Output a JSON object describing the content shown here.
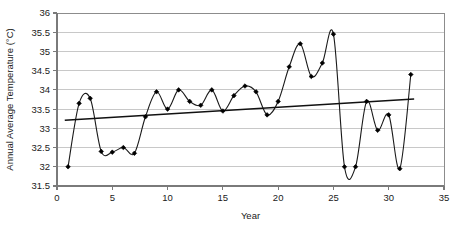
{
  "chart_data": {
    "type": "line",
    "title": "",
    "xlabel": "Year",
    "ylabel": "Annual Average Temperature (°C)",
    "xlim": [
      0,
      35
    ],
    "ylim": [
      31.5,
      36
    ],
    "xticks": [
      0,
      5,
      10,
      15,
      20,
      25,
      30,
      35
    ],
    "yticks": [
      31.5,
      32,
      32.5,
      33,
      33.5,
      34,
      34.5,
      35,
      35.5,
      36
    ],
    "xtick_labels": [
      "0",
      "5",
      "10",
      "15",
      "20",
      "25",
      "30",
      "35"
    ],
    "ytick_labels": [
      "31.5",
      "32",
      "32.5",
      "33",
      "33.5",
      "34",
      "34.5",
      "35",
      "35.5",
      "36"
    ],
    "grid": "horizontal",
    "legend": "none",
    "marker": "diamond",
    "line_color": "#1a1a1a",
    "marker_color": "#000000",
    "grid_color": "#c8c8c8",
    "axis_color": "#808080",
    "x": [
      1,
      2,
      3,
      4,
      5,
      6,
      7,
      8,
      9,
      10,
      11,
      12,
      13,
      14,
      15,
      16,
      17,
      18,
      19,
      20,
      21,
      22,
      23,
      24,
      25,
      26,
      27,
      28,
      29,
      30,
      31,
      32
    ],
    "values": [
      32.0,
      33.65,
      33.78,
      32.4,
      32.38,
      32.5,
      32.35,
      33.3,
      33.95,
      33.5,
      34.0,
      33.7,
      33.6,
      34.0,
      33.45,
      33.85,
      34.1,
      33.95,
      33.35,
      33.7,
      34.6,
      35.2,
      34.35,
      34.7,
      35.45,
      32.0,
      32.0,
      33.7,
      32.95,
      33.35,
      31.95,
      34.4
    ],
    "series": [
      {
        "name": "Annual Average Temperature",
        "values": [
          32.0,
          33.65,
          33.78,
          32.4,
          32.38,
          32.5,
          32.35,
          33.3,
          33.95,
          33.5,
          34.0,
          33.7,
          33.6,
          34.0,
          33.45,
          33.85,
          34.1,
          33.95,
          33.35,
          33.7,
          34.6,
          35.2,
          34.35,
          34.7,
          35.45,
          32.0,
          32.0,
          33.7,
          32.95,
          33.35,
          31.95,
          34.4
        ]
      }
    ],
    "trendline": {
      "name": "Linear trend",
      "x": [
        0.7,
        32.3
      ],
      "y": [
        33.21,
        33.76
      ],
      "color": "#111111"
    }
  }
}
